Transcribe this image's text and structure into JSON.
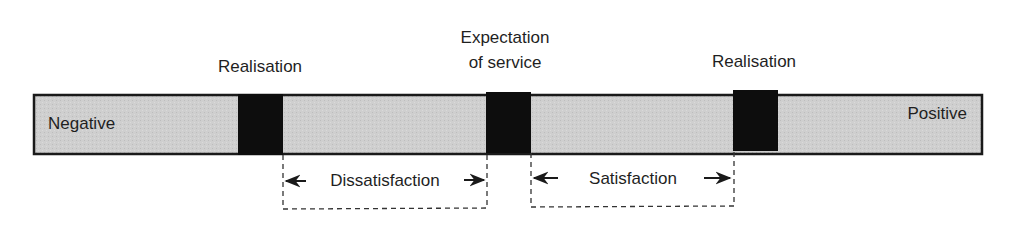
{
  "diagram": {
    "scale": {
      "left_label": "Negative",
      "right_label": "Positive"
    },
    "markers": [
      {
        "id": "realisation-low",
        "label_lines": [
          "Realisation"
        ]
      },
      {
        "id": "expectation",
        "label_lines": [
          "Expectation",
          "of service"
        ]
      },
      {
        "id": "realisation-high",
        "label_lines": [
          "Realisation"
        ]
      }
    ],
    "zones": [
      {
        "id": "dissatisfaction",
        "label": "Dissatisfaction"
      },
      {
        "id": "satisfaction",
        "label": "Satisfaction"
      }
    ],
    "colors": {
      "bar_fill": "#cfcfcf",
      "marker_fill": "#0d0d0d",
      "outline": "#1a1a1a"
    }
  }
}
